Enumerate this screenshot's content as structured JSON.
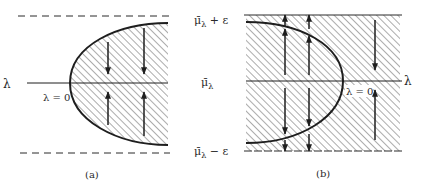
{
  "figure": {
    "panels": [
      {
        "id": "a",
        "caption": "(a)",
        "axis_label": "λ",
        "vertex_label": "λ = 0",
        "bound_style": "dashed"
      },
      {
        "id": "b",
        "caption": "(b)",
        "axis_label": "λ",
        "vertex_label": "λ = 0",
        "bound_style": "solid"
      }
    ],
    "labels": {
      "upper_bound_main": "μ̄",
      "upper_bound_sub": "λ",
      "upper_bound_suffix": " + ε",
      "middle_main": "μ̄",
      "middle_sub": "λ",
      "lower_bound_main": "μ̄",
      "lower_bound_sub": "λ",
      "lower_bound_suffix": " − ε"
    },
    "colors": {
      "ink": "#1e1e1e",
      "hatch": "#555555",
      "background": "#ffffff"
    }
  }
}
